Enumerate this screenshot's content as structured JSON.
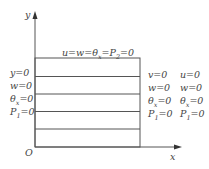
{
  "axes": {
    "x_label": "x",
    "y_label": "y",
    "origin_label": "O"
  },
  "top_boundary": {
    "parts": [
      "u=w=θ",
      "x",
      "=P",
      "2",
      "=0"
    ],
    "text": "u=w=θx=P2=0"
  },
  "left_boundary": [
    {
      "main": "y=0",
      "sub": ""
    },
    {
      "main": "w=0",
      "sub": ""
    },
    {
      "main": "θ",
      "sub": "x",
      "tail": "=0"
    },
    {
      "main": "P",
      "sub": "1",
      "tail": "=0"
    }
  ],
  "right_boundary_col1": [
    {
      "main": "v=0"
    },
    {
      "main": "w=0"
    },
    {
      "main": "θ",
      "sub": "x",
      "tail": "=0"
    },
    {
      "main": "P",
      "sub": "1",
      "tail": "=0"
    }
  ],
  "right_boundary_col2": [
    {
      "main": "u=0"
    },
    {
      "main": "w=0"
    },
    {
      "main": "θ",
      "sub": "x",
      "tail": "=0"
    },
    {
      "main": "P",
      "sub": "1",
      "tail": "=0"
    }
  ],
  "colors": {
    "line": "#555555",
    "text": "#444444"
  }
}
